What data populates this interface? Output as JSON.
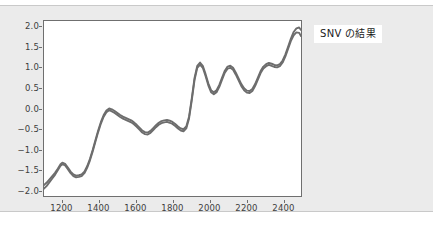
{
  "annotation": {
    "label": "SNV の結果"
  },
  "chart_data": {
    "type": "line",
    "title": "",
    "xlabel": "",
    "ylabel": "",
    "xlim": [
      1100,
      2500
    ],
    "ylim": [
      -2.15,
      2.15
    ],
    "grid": false,
    "legend": null,
    "xticks": [
      1200,
      1400,
      1600,
      1800,
      2000,
      2200,
      2400
    ],
    "yticks": [
      "2.0",
      "1.5",
      "1.0",
      "0.5",
      "0.0",
      "−0.5",
      "−1.0",
      "−1.5",
      "−2.0"
    ],
    "ytick_values": [
      2.0,
      1.5,
      1.0,
      0.5,
      0.0,
      -0.5,
      -1.0,
      -1.5,
      -2.0
    ],
    "line_color": "#6d6d6d",
    "series": [
      {
        "name": "SNV spectra",
        "x": [
          1100,
          1115,
          1130,
          1145,
          1160,
          1175,
          1190,
          1200,
          1215,
          1230,
          1245,
          1260,
          1275,
          1290,
          1305,
          1320,
          1335,
          1350,
          1365,
          1380,
          1395,
          1410,
          1425,
          1440,
          1455,
          1470,
          1485,
          1500,
          1515,
          1530,
          1545,
          1560,
          1575,
          1590,
          1605,
          1620,
          1635,
          1650,
          1665,
          1680,
          1695,
          1710,
          1725,
          1740,
          1755,
          1770,
          1785,
          1800,
          1815,
          1830,
          1845,
          1860,
          1875,
          1890,
          1905,
          1920,
          1935,
          1950,
          1965,
          1980,
          1995,
          2010,
          2025,
          2040,
          2055,
          2070,
          2085,
          2100,
          2115,
          2130,
          2145,
          2160,
          2175,
          2190,
          2205,
          2220,
          2235,
          2250,
          2265,
          2280,
          2295,
          2310,
          2325,
          2340,
          2355,
          2370,
          2385,
          2400,
          2415,
          2430,
          2445,
          2460,
          2475,
          2490,
          2500
        ],
        "y": [
          -1.88,
          -1.82,
          -1.74,
          -1.66,
          -1.58,
          -1.48,
          -1.37,
          -1.33,
          -1.36,
          -1.45,
          -1.55,
          -1.62,
          -1.65,
          -1.64,
          -1.62,
          -1.55,
          -1.42,
          -1.24,
          -1.02,
          -0.78,
          -0.54,
          -0.33,
          -0.16,
          -0.05,
          0.0,
          -0.02,
          -0.06,
          -0.11,
          -0.16,
          -0.2,
          -0.23,
          -0.26,
          -0.29,
          -0.34,
          -0.4,
          -0.47,
          -0.54,
          -0.58,
          -0.59,
          -0.55,
          -0.48,
          -0.41,
          -0.35,
          -0.31,
          -0.29,
          -0.28,
          -0.3,
          -0.33,
          -0.38,
          -0.44,
          -0.49,
          -0.51,
          -0.44,
          -0.2,
          0.25,
          0.75,
          1.05,
          1.13,
          1.05,
          0.85,
          0.62,
          0.45,
          0.4,
          0.45,
          0.58,
          0.76,
          0.93,
          1.03,
          1.05,
          1.0,
          0.88,
          0.74,
          0.6,
          0.5,
          0.44,
          0.43,
          0.48,
          0.6,
          0.76,
          0.92,
          1.03,
          1.09,
          1.12,
          1.1,
          1.07,
          1.06,
          1.09,
          1.18,
          1.33,
          1.52,
          1.72,
          1.88,
          1.97,
          1.99,
          1.93
        ]
      },
      {
        "name": "SNV spectra (band edge)",
        "x": [
          1100,
          1115,
          1130,
          1145,
          1160,
          1175,
          1190,
          1200,
          1215,
          1230,
          1245,
          1260,
          1275,
          1290,
          1305,
          1320,
          1335,
          1350,
          1365,
          1380,
          1395,
          1410,
          1425,
          1440,
          1455,
          1470,
          1485,
          1500,
          1515,
          1530,
          1545,
          1560,
          1575,
          1590,
          1605,
          1620,
          1635,
          1650,
          1665,
          1680,
          1695,
          1710,
          1725,
          1740,
          1755,
          1770,
          1785,
          1800,
          1815,
          1830,
          1845,
          1860,
          1875,
          1890,
          1905,
          1920,
          1935,
          1950,
          1965,
          1980,
          1995,
          2010,
          2025,
          2040,
          2055,
          2070,
          2085,
          2100,
          2115,
          2130,
          2145,
          2160,
          2175,
          2190,
          2205,
          2220,
          2235,
          2250,
          2265,
          2280,
          2295,
          2310,
          2325,
          2340,
          2355,
          2370,
          2385,
          2400,
          2415,
          2430,
          2445,
          2460,
          2475,
          2490,
          2500
        ],
        "y": [
          -1.97,
          -1.9,
          -1.81,
          -1.72,
          -1.63,
          -1.52,
          -1.41,
          -1.37,
          -1.4,
          -1.49,
          -1.59,
          -1.66,
          -1.69,
          -1.68,
          -1.66,
          -1.59,
          -1.46,
          -1.28,
          -1.06,
          -0.82,
          -0.58,
          -0.37,
          -0.2,
          -0.09,
          -0.04,
          -0.07,
          -0.11,
          -0.16,
          -0.21,
          -0.25,
          -0.28,
          -0.31,
          -0.34,
          -0.39,
          -0.45,
          -0.52,
          -0.59,
          -0.63,
          -0.64,
          -0.6,
          -0.53,
          -0.46,
          -0.4,
          -0.36,
          -0.34,
          -0.33,
          -0.35,
          -0.38,
          -0.43,
          -0.49,
          -0.54,
          -0.56,
          -0.49,
          -0.25,
          0.2,
          0.7,
          1.0,
          1.08,
          1.0,
          0.8,
          0.57,
          0.4,
          0.35,
          0.4,
          0.53,
          0.71,
          0.88,
          0.98,
          1.0,
          0.95,
          0.83,
          0.69,
          0.55,
          0.45,
          0.39,
          0.38,
          0.43,
          0.55,
          0.71,
          0.87,
          0.98,
          1.04,
          1.07,
          1.05,
          1.02,
          1.01,
          1.04,
          1.13,
          1.28,
          1.47,
          1.66,
          1.8,
          1.87,
          1.86,
          1.78
        ]
      }
    ]
  }
}
